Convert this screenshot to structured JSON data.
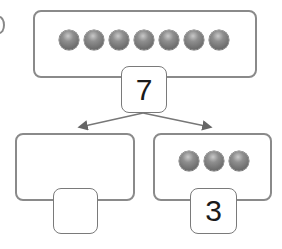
{
  "diagram": {
    "type": "number-bond",
    "whole": {
      "balls": 7,
      "label": "7"
    },
    "parts": [
      {
        "balls": 0,
        "label": ""
      },
      {
        "balls": 3,
        "label": "3"
      }
    ],
    "colors": {
      "border": "#8a8a8a",
      "ball": "#7a7a7a",
      "arrow": "#666666"
    }
  }
}
